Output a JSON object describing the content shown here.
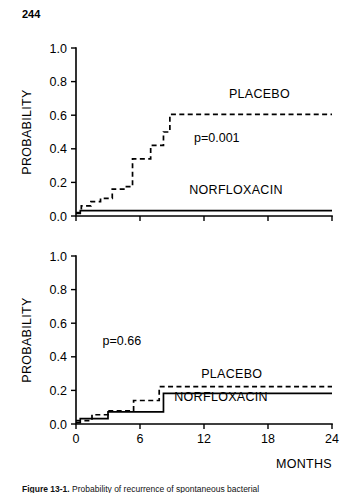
{
  "page": {
    "page_number": "244"
  },
  "caption": {
    "figure_label": "Figure 13-1.",
    "text": "Probability of recurrence of spontaneous bacterial"
  },
  "figure": {
    "x_axis_title": "MONTHS",
    "y_axis_title": "PROBABILITY"
  },
  "chart_data": [
    {
      "type": "line",
      "panel": "top",
      "title": "",
      "xlabel": "",
      "ylabel": "PROBABILITY",
      "xlim": [
        0,
        24
      ],
      "ylim": [
        0,
        1.0
      ],
      "xticks": [
        0,
        6,
        12,
        18,
        24
      ],
      "xtick_labels": [
        "",
        "",
        "",
        "",
        ""
      ],
      "yticks": [
        0.0,
        0.2,
        0.4,
        0.6,
        0.8,
        1.0
      ],
      "ytick_labels": [
        "0.0",
        "0.2",
        "0.4",
        "0.6",
        "0.8",
        "1.0"
      ],
      "grid": false,
      "legend": "inline-annotations",
      "annotations": [
        {
          "name": "p-value",
          "text": "p=0.001",
          "x": 13.2,
          "y": 0.44
        },
        {
          "name": "placebo-label",
          "text": "PLACEBO",
          "x": 17.2,
          "y": 0.7
        },
        {
          "name": "norfloxacin-label",
          "text": "NORFLOXACIN",
          "x": 15.0,
          "y": 0.13
        }
      ],
      "series": [
        {
          "name": "PLACEBO",
          "style": "dashed",
          "step": "post",
          "x": [
            0,
            0.5,
            0.5,
            1.4,
            1.4,
            2.3,
            2.3,
            3.4,
            3.4,
            4.6,
            4.6,
            5.3,
            5.3,
            6.0,
            6.0,
            7.0,
            7.0,
            8.2,
            8.2,
            8.8,
            8.8,
            24
          ],
          "y": [
            0.02,
            0.02,
            0.06,
            0.06,
            0.085,
            0.085,
            0.105,
            0.105,
            0.16,
            0.16,
            0.175,
            0.175,
            0.34,
            0.34,
            0.34,
            0.34,
            0.42,
            0.42,
            0.5,
            0.5,
            0.605,
            0.605
          ]
        },
        {
          "name": "NORFLOXACIN",
          "style": "solid",
          "step": "post",
          "x": [
            0,
            0.4,
            0.4,
            24
          ],
          "y": [
            0.015,
            0.015,
            0.032,
            0.032
          ]
        }
      ]
    },
    {
      "type": "line",
      "panel": "bottom",
      "title": "",
      "xlabel": "MONTHS",
      "ylabel": "PROBABILITY",
      "xlim": [
        0,
        24
      ],
      "ylim": [
        0,
        1.0
      ],
      "xticks": [
        0,
        6,
        12,
        18,
        24
      ],
      "xtick_labels": [
        "0",
        "6",
        "12",
        "18",
        "24"
      ],
      "yticks": [
        0.0,
        0.2,
        0.4,
        0.6,
        0.8,
        1.0
      ],
      "ytick_labels": [
        "0.0",
        "0.2",
        "0.4",
        "0.6",
        "0.8",
        "1.0"
      ],
      "grid": false,
      "legend": "inline-annotations",
      "annotations": [
        {
          "name": "p-value",
          "text": "p=0.66",
          "x": 4.3,
          "y": 0.47
        },
        {
          "name": "placebo-label",
          "text": "PLACEBO",
          "x": 14.6,
          "y": 0.275
        },
        {
          "name": "norfloxacin-label",
          "text": "NORFLOXACIN",
          "x": 13.6,
          "y": 0.135
        }
      ],
      "series": [
        {
          "name": "PLACEBO",
          "style": "dashed",
          "step": "post",
          "x": [
            0,
            1.5,
            1.5,
            3.0,
            3.0,
            5.4,
            5.4,
            7.8,
            7.8,
            24
          ],
          "y": [
            0.02,
            0.02,
            0.055,
            0.055,
            0.078,
            0.078,
            0.14,
            0.14,
            0.222,
            0.222
          ]
        },
        {
          "name": "NORFLOXACIN",
          "style": "solid",
          "step": "post",
          "x": [
            0,
            0.4,
            0.4,
            3.0,
            3.0,
            8.2,
            8.2,
            24
          ],
          "y": [
            0.008,
            0.008,
            0.032,
            0.032,
            0.072,
            0.072,
            0.182,
            0.182
          ]
        }
      ]
    }
  ]
}
